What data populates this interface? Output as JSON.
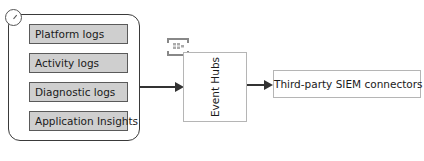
{
  "diagram": {
    "sources": [
      {
        "label": "Platform logs"
      },
      {
        "label": "Activity logs"
      },
      {
        "label": "Diagnostic logs"
      },
      {
        "label": "Application Insights"
      }
    ],
    "hub": {
      "label": "Event Hubs",
      "icon": "event-hubs-icon"
    },
    "destination": {
      "label": "Third-party SIEM connectors"
    },
    "container_icon": "gauge-icon",
    "colors": {
      "source_fill": "#cfcfcf",
      "border": "#3a3a3a",
      "arrow": "#333333"
    }
  }
}
